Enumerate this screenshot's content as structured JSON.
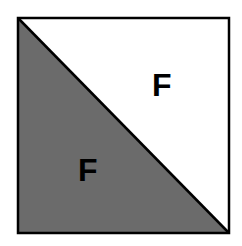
{
  "diagram": {
    "square": {
      "x": 18,
      "y": 18,
      "size": 211,
      "stroke": "#000000"
    },
    "shaded_triangle": {
      "fill": "#6b6b6b",
      "region": "lower-left"
    },
    "unshaded_triangle": {
      "fill": "#ffffff",
      "region": "upper-right"
    },
    "labels": {
      "upper": "F",
      "lower": "F"
    }
  }
}
